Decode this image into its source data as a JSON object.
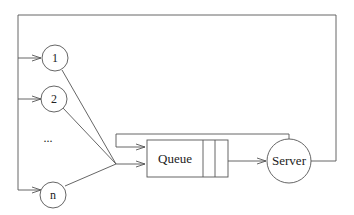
{
  "diagram": {
    "type": "queueing-system",
    "sources": [
      {
        "id": "source-1",
        "label": "1"
      },
      {
        "id": "source-2",
        "label": "2"
      },
      {
        "id": "source-n",
        "label": "n"
      }
    ],
    "ellipsis": "...",
    "queue": {
      "label": "Queue"
    },
    "server": {
      "label": "Server"
    },
    "edges": [
      {
        "from": "source-1",
        "to": "queue"
      },
      {
        "from": "source-2",
        "to": "queue"
      },
      {
        "from": "source-n",
        "to": "queue"
      },
      {
        "from": "queue",
        "to": "server"
      },
      {
        "from": "server",
        "to": "queue",
        "kind": "feedback"
      },
      {
        "from": "server",
        "to": "sources",
        "kind": "feedback"
      }
    ],
    "colors": {
      "stroke": "#555555",
      "text": "#222222",
      "background": "#ffffff"
    }
  }
}
